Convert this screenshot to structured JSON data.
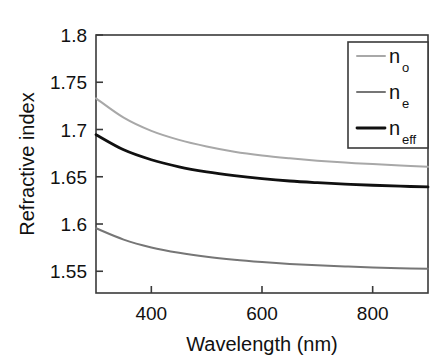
{
  "chart_data": {
    "type": "line",
    "title": "",
    "xlabel": "Wavelength (nm)",
    "ylabel": "Refractive index",
    "xlim": [
      300,
      900
    ],
    "ylim": [
      1.527,
      1.8
    ],
    "xticks": [
      400,
      600,
      800
    ],
    "xticklabels": [
      "400",
      "600",
      "800"
    ],
    "yticks": [
      1.55,
      1.6,
      1.65,
      1.7,
      1.75,
      1.8
    ],
    "yticklabels": [
      "1.55",
      "1.6",
      "1.65",
      "1.7",
      "1.75",
      "1.8"
    ],
    "grid": false,
    "legend_position": "upper right",
    "x": [
      300,
      350,
      400,
      450,
      500,
      550,
      600,
      650,
      700,
      750,
      800,
      850,
      900
    ],
    "series": [
      {
        "name": "n_o",
        "label_base": "n",
        "label_sub": "o",
        "color": "#a8a8a8",
        "linewidth": 2.0,
        "values": [
          1.733,
          1.7125,
          1.6985,
          1.689,
          1.682,
          1.6765,
          1.6725,
          1.6695,
          1.667,
          1.665,
          1.6635,
          1.662,
          1.6605
        ]
      },
      {
        "name": "n_eff",
        "label_base": "n",
        "label_sub": "eff",
        "color": "#101010",
        "linewidth": 2.8,
        "values": [
          1.6945,
          1.6785,
          1.668,
          1.6605,
          1.6552,
          1.6512,
          1.648,
          1.6455,
          1.6437,
          1.6422,
          1.641,
          1.64,
          1.6392
        ]
      },
      {
        "name": "n_e",
        "label_base": "n",
        "label_sub": "e",
        "color": "#767676",
        "linewidth": 2.0,
        "values": [
          1.5955,
          1.5835,
          1.5752,
          1.5695,
          1.5653,
          1.5622,
          1.5598,
          1.5578,
          1.5563,
          1.5551,
          1.5541,
          1.5533,
          1.5526
        ]
      }
    ]
  },
  "legend": {
    "entries": [
      {
        "base": "n",
        "sub": "o"
      },
      {
        "base": "n",
        "sub": "e"
      },
      {
        "base": "n",
        "sub": "eff"
      }
    ]
  },
  "axes": {
    "y_title": "Refractive index",
    "x_title": "Wavelength (nm)"
  },
  "colors": {
    "n_o": "#a8a8a8",
    "n_e": "#767676",
    "n_eff": "#101010",
    "axis": "#3a3a3a",
    "background": "#ffffff"
  }
}
